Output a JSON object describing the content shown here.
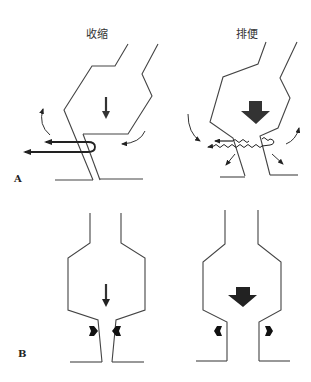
{
  "panel_a": {
    "label": "A",
    "left_title": "收缩",
    "right_title": "排便"
  },
  "panel_b": {
    "label": "B"
  },
  "colors": {
    "line": "#444444",
    "arrow": "#222222",
    "background": "#ffffff"
  }
}
